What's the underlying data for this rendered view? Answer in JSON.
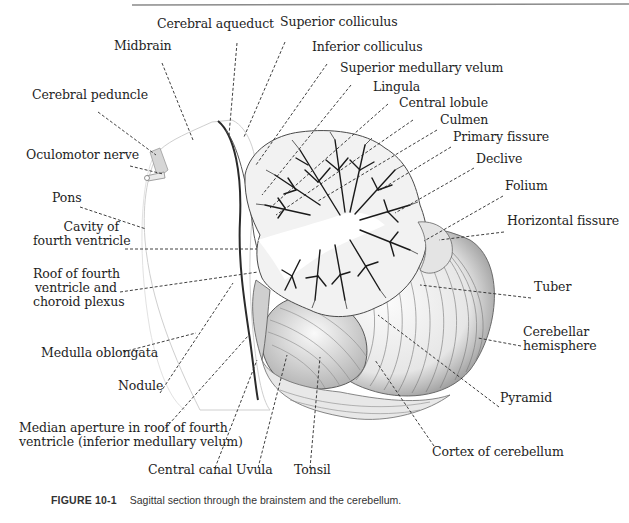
{
  "figure": {
    "number": "FIGURE 10-1",
    "caption": "Sagittal section through the brainstem and the cerebellum."
  },
  "colors": {
    "ink": "#1e1e1e",
    "rule": "#8a8a8a",
    "leader": "#2a2a2a",
    "tissue_light": "#f4f4f4",
    "tissue_mid": "#d8d8d8",
    "arbor_dark": "#1a1a1a"
  },
  "labels": [
    {
      "id": "cerebral-aqueduct",
      "text": "Cerebral aqueduct",
      "x": 157,
      "y": 28,
      "align": "left",
      "line": [
        [
          237,
          43
        ],
        [
          229,
          135
        ]
      ]
    },
    {
      "id": "superior-colliculus",
      "text": "Superior colliculus",
      "x": 280,
      "y": 26,
      "align": "left",
      "line": [
        [
          285,
          42
        ],
        [
          244,
          137
        ]
      ]
    },
    {
      "id": "midbrain",
      "text": "Midbrain",
      "x": 114,
      "y": 50,
      "align": "left",
      "line": [
        [
          162,
          63
        ],
        [
          193,
          140
        ]
      ]
    },
    {
      "id": "inferior-colliculus",
      "text": "Inferior colliculus",
      "x": 312,
      "y": 51,
      "align": "left",
      "line": [
        [
          327,
          64
        ],
        [
          256,
          165
        ]
      ]
    },
    {
      "id": "superior-medullary-velum",
      "text": "Superior medullary velum",
      "x": 340,
      "y": 72,
      "align": "left",
      "line": [
        [
          351,
          85
        ],
        [
          262,
          195
        ]
      ]
    },
    {
      "id": "lingula",
      "text": "Lingula",
      "x": 373,
      "y": 91,
      "align": "left",
      "line": [
        [
          388,
          104
        ],
        [
          270,
          208
        ]
      ]
    },
    {
      "id": "central-lobule",
      "text": "Central lobule",
      "x": 399,
      "y": 107,
      "align": "left",
      "line": [
        [
          413,
          120
        ],
        [
          276,
          215
        ]
      ]
    },
    {
      "id": "culmen",
      "text": "Culmen",
      "x": 440,
      "y": 124,
      "align": "left",
      "line": [
        [
          437,
          130
        ],
        [
          318,
          201
        ]
      ]
    },
    {
      "id": "primary-fissure",
      "text": "Primary fissure",
      "x": 453,
      "y": 141,
      "align": "left",
      "line": [
        [
          451,
          147
        ],
        [
          380,
          190
        ]
      ]
    },
    {
      "id": "declive",
      "text": "Declive",
      "x": 476,
      "y": 163,
      "align": "left",
      "line": [
        [
          474,
          168
        ],
        [
          395,
          213
        ]
      ]
    },
    {
      "id": "folium",
      "text": "Folium",
      "x": 505,
      "y": 190,
      "align": "left",
      "line": [
        [
          503,
          196
        ],
        [
          424,
          241
        ]
      ]
    },
    {
      "id": "horizontal-fissure",
      "text": "Horizontal fissure",
      "x": 507,
      "y": 225,
      "align": "left",
      "line": [
        [
          504,
          232
        ],
        [
          439,
          240
        ]
      ]
    },
    {
      "id": "cerebral-peduncle",
      "text": "Cerebral peduncle",
      "x": 32,
      "y": 99,
      "align": "left",
      "line": [
        [
          98,
          112
        ],
        [
          156,
          155
        ]
      ]
    },
    {
      "id": "oculomotor-nerve",
      "text": "Oculomotor nerve",
      "x": 26,
      "y": 159,
      "align": "left",
      "line": [
        [
          130,
          166
        ],
        [
          163,
          174
        ]
      ]
    },
    {
      "id": "pons",
      "text": "Pons",
      "x": 52,
      "y": 202,
      "align": "left",
      "line": [
        [
          80,
          207
        ],
        [
          146,
          229
        ]
      ]
    },
    {
      "id": "cavity-fourth-ventricle",
      "lines": [
        "Cavity of",
        "fourth ventricle"
      ],
      "x": 33,
      "y": 231,
      "align": "right",
      "w": 86,
      "line": [
        [
          125,
          249
        ],
        [
          257,
          249
        ]
      ]
    },
    {
      "id": "roof-fourth-ventricle",
      "lines": [
        "Roof of fourth",
        "ventricle and",
        "choroid plexus"
      ],
      "x": 33,
      "y": 278,
      "align": "right",
      "w": 84,
      "line": [
        [
          120,
          292
        ],
        [
          258,
          272
        ]
      ]
    },
    {
      "id": "medulla-oblongata",
      "text": "Medulla oblongata",
      "x": 41,
      "y": 357,
      "align": "left",
      "line": [
        [
          123,
          352
        ],
        [
          196,
          333
        ]
      ]
    },
    {
      "id": "nodule",
      "text": "Nodule",
      "x": 118,
      "y": 390,
      "align": "left",
      "line": [
        [
          160,
          393
        ],
        [
          233,
          283
        ]
      ]
    },
    {
      "id": "median-aperture",
      "lines": [
        "Median aperture in roof of fourth",
        "ventricle (inferior medullary velum)"
      ],
      "x": 19,
      "y": 432,
      "align": "left",
      "w": 220,
      "line": [
        [
          162,
          432
        ],
        [
          248,
          336
        ]
      ]
    },
    {
      "id": "central-canal",
      "text": "Central canal",
      "x": 148,
      "y": 474,
      "align": "left",
      "line": [
        [
          215,
          468
        ],
        [
          257,
          360
        ]
      ]
    },
    {
      "id": "uvula",
      "text": "Uvula",
      "x": 236,
      "y": 474,
      "align": "left",
      "line": [
        [
          258,
          468
        ],
        [
          287,
          355
        ]
      ]
    },
    {
      "id": "tonsil",
      "text": "Tonsil",
      "x": 294,
      "y": 474,
      "align": "left",
      "line": [
        [
          310,
          468
        ],
        [
          320,
          357
        ]
      ]
    },
    {
      "id": "cortex-of-cerebellum",
      "text": "Cortex of cerebellum",
      "x": 432,
      "y": 456,
      "align": "left",
      "line": [
        [
          434,
          446
        ],
        [
          375,
          360
        ]
      ]
    },
    {
      "id": "pyramid",
      "text": "Pyramid",
      "x": 500,
      "y": 402,
      "align": "left",
      "line": [
        [
          499,
          407
        ],
        [
          378,
          315
        ]
      ]
    },
    {
      "id": "cerebellar-hemisphere",
      "lines": [
        "Cerebellar",
        "hemisphere"
      ],
      "x": 523,
      "y": 336,
      "align": "left",
      "w": 80,
      "line": [
        [
          521,
          346
        ],
        [
          478,
          338
        ]
      ]
    },
    {
      "id": "tuber",
      "text": "Tuber",
      "x": 534,
      "y": 291,
      "align": "left",
      "line": [
        [
          531,
          298
        ],
        [
          420,
          285
        ]
      ]
    }
  ]
}
